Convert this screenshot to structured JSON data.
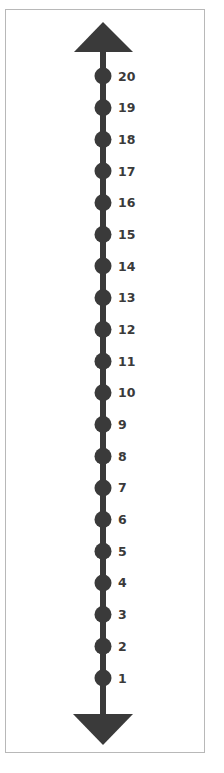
{
  "number_line": {
    "orientation": "vertical",
    "min": 1,
    "max": 20,
    "step": 1,
    "arrows": [
      "up",
      "down"
    ],
    "color": "#3a3a3a",
    "border_color": "#b8b8b8",
    "labels": [
      "20",
      "19",
      "18",
      "17",
      "16",
      "15",
      "14",
      "13",
      "12",
      "11",
      "10",
      "9",
      "8",
      "7",
      "6",
      "5",
      "4",
      "3",
      "2",
      "1"
    ]
  }
}
